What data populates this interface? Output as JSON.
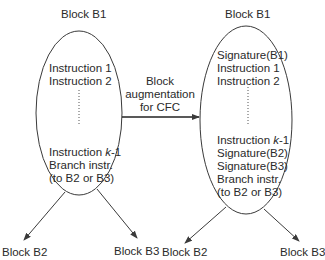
{
  "diagram": {
    "left_block": {
      "title": "Block B1",
      "lines_top": [
        "Instruction 1",
        "Instruction 2"
      ],
      "line_k_prefix": "Instruction ",
      "line_k_var": "k",
      "line_k_suffix": "-1",
      "lines_bottom": [
        "Branch instr.",
        "(to B2 or B3)"
      ],
      "successors": [
        "Block B2",
        "Block B3"
      ]
    },
    "transform_label": {
      "line1": "Block",
      "line2": "augmentation",
      "line3": "for CFC"
    },
    "right_block": {
      "title": "Block B1",
      "lines_top": [
        "Signature(B1)",
        "Instruction 1",
        "Instruction 2"
      ],
      "line_k_prefix": "Instruction ",
      "line_k_var": "k",
      "line_k_suffix": "-1",
      "lines_bottom": [
        "Signature(B2)",
        "Signature(B3)",
        "Branch instr.",
        "(to B2 or B3)"
      ],
      "successors": [
        "Block B2",
        "Block B3"
      ]
    },
    "colors": {
      "stroke": "#3a3a3a",
      "text": "#2a2a2a",
      "background": "#ffffff"
    }
  }
}
